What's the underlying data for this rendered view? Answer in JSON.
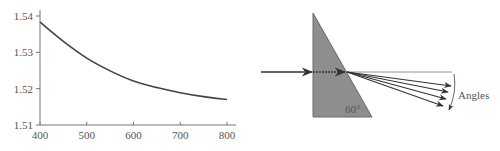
{
  "chart_data": {
    "type": "line",
    "title": "",
    "xlabel": "",
    "ylabel": "",
    "x": [
      400,
      450,
      500,
      550,
      600,
      650,
      700,
      750,
      800
    ],
    "series": [
      {
        "name": "Refractive index vs wavelength",
        "values": [
          1.5383,
          1.533,
          1.5284,
          1.5249,
          1.5221,
          1.5203,
          1.5189,
          1.5178,
          1.517
        ]
      }
    ],
    "xlim": [
      400,
      830
    ],
    "ylim": [
      1.51,
      1.54
    ],
    "xticks": [
      "400",
      "500",
      "600",
      "700",
      "800"
    ],
    "yticks": [
      "1.51",
      "1.52",
      "1.53",
      "1.54"
    ],
    "grid": false,
    "line_color": "#444444"
  },
  "diagram": {
    "prism_angle_label": "60°",
    "dispersion_label": "Angles",
    "ray_count": 5,
    "prism_fill": "#8e8e8e",
    "prism_edge": "#6a6a6a",
    "ray_color": "#333333"
  }
}
